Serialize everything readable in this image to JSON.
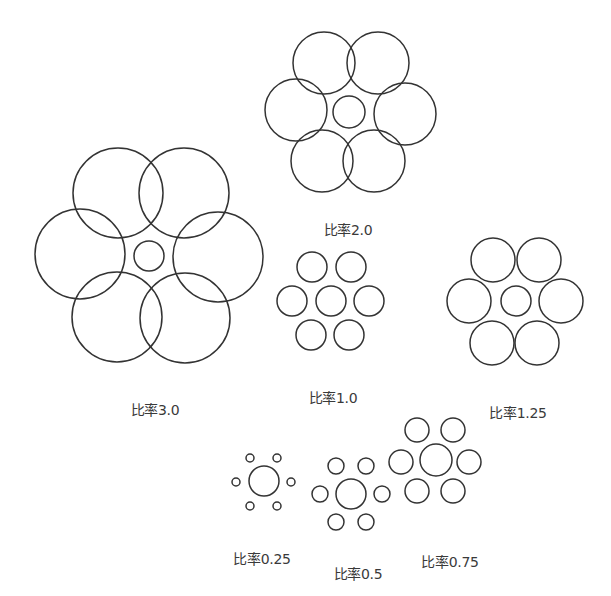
{
  "diagram": {
    "stroke_color": "#333333",
    "background": "#ffffff",
    "groups": [
      {
        "id": "ratio-3-0",
        "label": "比率3.0",
        "label_pos": [
          155,
          408
        ],
        "center": {
          "cx": 149,
          "cy": 256,
          "r": 15
        },
        "outer": [
          {
            "cx": 118,
            "cy": 193,
            "r": 45
          },
          {
            "cx": 184,
            "cy": 193,
            "r": 45
          },
          {
            "cx": 80,
            "cy": 254,
            "r": 45
          },
          {
            "cx": 218,
            "cy": 257,
            "r": 45
          },
          {
            "cx": 117,
            "cy": 317,
            "r": 45
          },
          {
            "cx": 185,
            "cy": 318,
            "r": 45
          }
        ]
      },
      {
        "id": "ratio-2-0",
        "label": "比率2.0",
        "label_pos": [
          348,
          228
        ],
        "center": {
          "cx": 349,
          "cy": 112,
          "r": 16
        },
        "outer": [
          {
            "cx": 324,
            "cy": 63,
            "r": 31
          },
          {
            "cx": 378,
            "cy": 63,
            "r": 31
          },
          {
            "cx": 296,
            "cy": 110,
            "r": 31
          },
          {
            "cx": 405,
            "cy": 114,
            "r": 31
          },
          {
            "cx": 322,
            "cy": 161,
            "r": 31
          },
          {
            "cx": 374,
            "cy": 161,
            "r": 31
          }
        ]
      },
      {
        "id": "ratio-1-0",
        "label": "比率1.0",
        "label_pos": [
          333,
          396
        ],
        "center": {
          "cx": 331,
          "cy": 301,
          "r": 15
        },
        "outer": [
          {
            "cx": 312,
            "cy": 267,
            "r": 15
          },
          {
            "cx": 351,
            "cy": 267,
            "r": 15
          },
          {
            "cx": 292,
            "cy": 301,
            "r": 15
          },
          {
            "cx": 369,
            "cy": 301,
            "r": 15
          },
          {
            "cx": 311,
            "cy": 335,
            "r": 15
          },
          {
            "cx": 349,
            "cy": 335,
            "r": 15
          }
        ]
      },
      {
        "id": "ratio-1-25",
        "label": "比率1.25",
        "label_pos": [
          518,
          411
        ],
        "center": {
          "cx": 516,
          "cy": 301,
          "r": 15
        },
        "outer": [
          {
            "cx": 493,
            "cy": 260,
            "r": 22
          },
          {
            "cx": 539,
            "cy": 260,
            "r": 22
          },
          {
            "cx": 469,
            "cy": 301,
            "r": 22
          },
          {
            "cx": 561,
            "cy": 301,
            "r": 22
          },
          {
            "cx": 492,
            "cy": 343,
            "r": 22
          },
          {
            "cx": 537,
            "cy": 343,
            "r": 22
          }
        ]
      },
      {
        "id": "ratio-0-25",
        "label": "比率0.25",
        "label_pos": [
          262,
          557
        ],
        "center": {
          "cx": 264,
          "cy": 481,
          "r": 15
        },
        "outer": [
          {
            "cx": 250,
            "cy": 458,
            "r": 4
          },
          {
            "cx": 277,
            "cy": 458,
            "r": 4
          },
          {
            "cx": 236,
            "cy": 482,
            "r": 4
          },
          {
            "cx": 291,
            "cy": 482,
            "r": 4
          },
          {
            "cx": 250,
            "cy": 506,
            "r": 4
          },
          {
            "cx": 277,
            "cy": 506,
            "r": 4
          }
        ]
      },
      {
        "id": "ratio-0-5",
        "label": "比率0.5",
        "label_pos": [
          358,
          572
        ],
        "center": {
          "cx": 351,
          "cy": 494,
          "r": 15
        },
        "outer": [
          {
            "cx": 336,
            "cy": 466,
            "r": 8
          },
          {
            "cx": 366,
            "cy": 466,
            "r": 8
          },
          {
            "cx": 320,
            "cy": 494,
            "r": 8
          },
          {
            "cx": 382,
            "cy": 494,
            "r": 8
          },
          {
            "cx": 336,
            "cy": 522,
            "r": 8
          },
          {
            "cx": 366,
            "cy": 522,
            "r": 8
          }
        ]
      },
      {
        "id": "ratio-0-75",
        "label": "比率0.75",
        "label_pos": [
          450,
          560
        ],
        "center": {
          "cx": 436,
          "cy": 460,
          "r": 16
        },
        "outer": [
          {
            "cx": 417,
            "cy": 430,
            "r": 12
          },
          {
            "cx": 453,
            "cy": 430,
            "r": 12
          },
          {
            "cx": 401,
            "cy": 462,
            "r": 12
          },
          {
            "cx": 469,
            "cy": 462,
            "r": 12
          },
          {
            "cx": 417,
            "cy": 491,
            "r": 12
          },
          {
            "cx": 453,
            "cy": 491,
            "r": 12
          }
        ]
      }
    ]
  }
}
